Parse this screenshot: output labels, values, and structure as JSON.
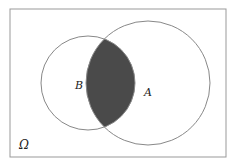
{
  "diagram": {
    "type": "venn",
    "universe_label": "Ω",
    "sets": [
      {
        "name": "A",
        "label": "A"
      },
      {
        "name": "B",
        "label": "B"
      }
    ],
    "shaded_region": "A ∩ B",
    "colors": {
      "shade": "#4a4a4a",
      "stroke": "#888888",
      "background": "#ffffff"
    }
  }
}
